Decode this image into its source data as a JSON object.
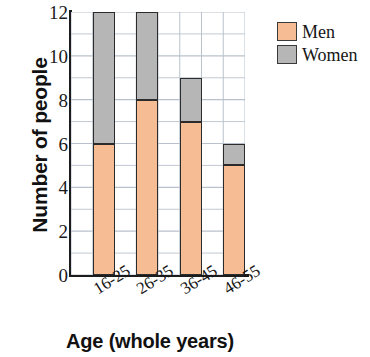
{
  "chart_data": {
    "type": "bar",
    "subtype": "stacked-vertical-bar",
    "title": "",
    "categories": [
      "16-25",
      "26-35",
      "36-45",
      "46-55"
    ],
    "series": [
      {
        "name": "Men",
        "values": [
          6,
          8,
          7,
          5
        ],
        "color": "#f6bd94"
      },
      {
        "name": "Women",
        "values": [
          6,
          4,
          2,
          1
        ],
        "color": "#b6b6b6"
      }
    ],
    "totals": [
      12,
      12,
      9,
      6
    ],
    "xlabel": "Age (whole years)",
    "ylabel": "Number of people",
    "ylim": [
      0,
      12
    ],
    "ytick_labels": [
      "0",
      "2",
      "4",
      "6",
      "8",
      "10",
      "12"
    ],
    "ytick_values": [
      0,
      2,
      4,
      6,
      8,
      10,
      12
    ],
    "y_major_step": 2,
    "y_minor_step": 1,
    "grid": true,
    "grid_color": "#b9c2cc",
    "legend_position": "right-top",
    "legend_entries": [
      "Men",
      "Women"
    ],
    "xtick_rotation_deg": -32,
    "bar_edge_color": "#2b2b2b",
    "axis_color": "#1c1c1c"
  }
}
